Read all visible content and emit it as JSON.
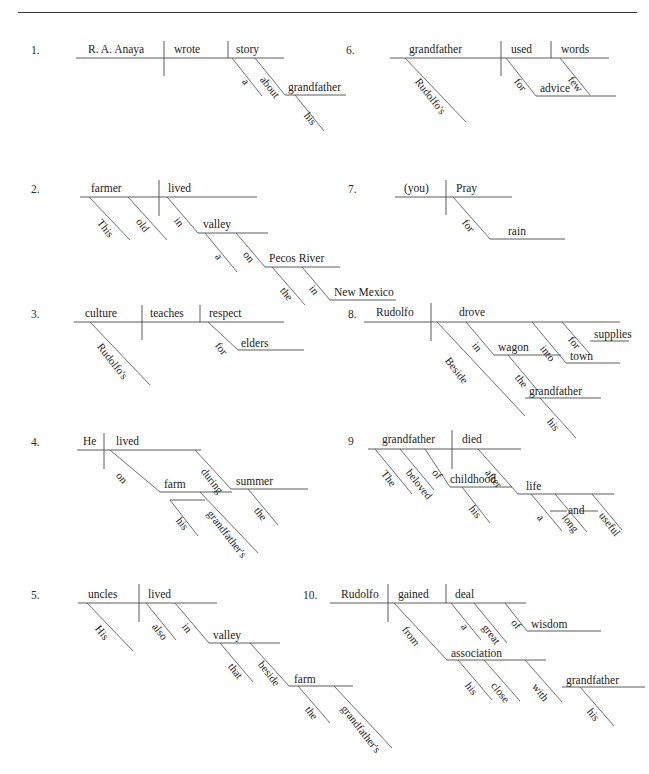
{
  "header": {
    "left_text": "",
    "right_text": ""
  },
  "worksheet": {
    "title": "Sentence Diagramming Exercises",
    "items": [
      {
        "number": "1.",
        "sentence": "R. A. Anaya wrote a story about his grandfather.",
        "words": {
          "subject": "R. A. Anaya",
          "verb": "wrote",
          "object": "story",
          "article": "a",
          "prep": "about",
          "prep_object": "grandfather",
          "possessive": "his"
        }
      },
      {
        "number": "2.",
        "sentence": "This old farmer lived in a valley on the Pecos River in New Mexico.",
        "words": {
          "subject": "farmer",
          "verb": "lived",
          "mod1": "This",
          "mod2": "old",
          "prep1": "in",
          "prep1_object": "valley",
          "article1": "a",
          "prep2": "on",
          "prep2_object": "Pecos River",
          "article2": "the",
          "prep3": "in",
          "prep3_object": "New Mexico"
        }
      },
      {
        "number": "3.",
        "sentence": "Rudolfo's culture teaches respect for elders.",
        "words": {
          "subject": "culture",
          "verb": "teaches",
          "object": "respect",
          "possessive": "Rudolfo's",
          "prep": "for",
          "prep_object": "elders"
        }
      },
      {
        "number": "4.",
        "sentence": "He lived on his grandfather's farm during the summer.",
        "words": {
          "subject": "He",
          "verb": "lived",
          "prep1": "on",
          "prep1_object": "farm",
          "possessive1": "grandfather's",
          "possessive2": "his",
          "prep2": "during",
          "prep2_object": "summer",
          "article": "the"
        }
      },
      {
        "number": "5.",
        "sentence": "His uncles also lived in that valley beside the grandfather's farm.",
        "words": {
          "subject": "uncles",
          "verb": "lived",
          "possessive": "His",
          "adverb": "also",
          "prep1": "in",
          "prep1_object": "valley",
          "mod1": "that",
          "prep2": "beside",
          "prep2_object": "farm",
          "article": "the",
          "possessive2": "grandfather's"
        }
      },
      {
        "number": "6.",
        "sentence": "Rudolfo's grandfather used few words for advice.",
        "words": {
          "subject": "grandfather",
          "verb": "used",
          "object": "words",
          "possessive": "Rudolfo's",
          "mod": "few",
          "prep": "for",
          "prep_object": "advice"
        }
      },
      {
        "number": "7.",
        "sentence": "(you) Pray for rain.",
        "words": {
          "subject": "(you)",
          "verb": "Pray",
          "prep": "for",
          "prep_object": "rain"
        }
      },
      {
        "number": "8.",
        "sentence": "Beside his grandfather Rudolfo drove in the wagon into town for supplies.",
        "words": {
          "subject": "Rudolfo",
          "verb": "drove",
          "prep1": "in",
          "prep1_object": "wagon",
          "article1": "the",
          "prep2": "into",
          "prep2_object": "town",
          "prep3": "for",
          "prep3_object": "supplies",
          "prep4": "Beside",
          "prep4_object": "grandfather",
          "possessive": "his"
        }
      },
      {
        "number": "9",
        "sentence": "The beloved grandfather of his childhood died after a long and useful life.",
        "words": {
          "subject": "grandfather",
          "verb": "died",
          "mod1": "The",
          "mod2": "beloved",
          "prep1": "of",
          "prep1_object": "childhood",
          "possessive": "his",
          "prep2": "after",
          "prep2_object": "life",
          "article": "a",
          "conj": "and",
          "adj1": "long",
          "adj2": "useful"
        }
      },
      {
        "number": "10.",
        "sentence": "Rudolfo gained a great deal of wisdom from his close association with his grandfather.",
        "words": {
          "subject": "Rudolfo",
          "verb": "gained",
          "object": "deal",
          "article": "a",
          "mod": "great",
          "prep1": "of",
          "prep1_object": "wisdom",
          "prep2": "from",
          "prep2_object": "association",
          "possessive1": "his",
          "mod2": "close",
          "prep3": "with",
          "prep3_object": "grandfather",
          "possessive2": "his"
        }
      }
    ]
  },
  "style": {
    "line_color": "#4a4a4a",
    "text_color": "#232323",
    "background": "#ffffff"
  }
}
